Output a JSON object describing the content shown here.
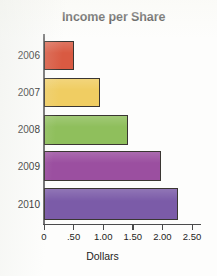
{
  "chart_data": {
    "type": "bar",
    "orientation": "horizontal",
    "title": "Income per Share",
    "xlabel": "Dollars",
    "ylabel": "",
    "categories": [
      "2006",
      "2007",
      "2008",
      "2009",
      "2010"
    ],
    "values": [
      0.51,
      0.95,
      1.42,
      1.98,
      2.26
    ],
    "xlim": [
      0,
      2.5
    ],
    "xticks": [
      0,
      0.5,
      1.0,
      1.5,
      2.0,
      2.5
    ],
    "xtick_labels": [
      "0",
      ".50",
      "1.00",
      "1.50",
      "2.00",
      "2.50"
    ],
    "grid": false,
    "legend": false,
    "bar_colors": [
      "#d95a42",
      "#f0cd62",
      "#8fbf5c",
      "#9b4fa0",
      "#7b5ba8"
    ],
    "bar_edge_color": "#3a3632",
    "axis_color": "#4a4a4b",
    "series": [
      {
        "name": "Income per Share",
        "points": [
          {
            "category": "2006",
            "value": 0.51,
            "color": "#d95a42"
          },
          {
            "category": "2007",
            "value": 0.95,
            "color": "#f0cd62"
          },
          {
            "category": "2008",
            "value": 1.42,
            "color": "#8fbf5c"
          },
          {
            "category": "2009",
            "value": 1.98,
            "color": "#9b4fa0"
          },
          {
            "category": "2010",
            "value": 2.26,
            "color": "#7b5ba8"
          }
        ]
      }
    ]
  }
}
